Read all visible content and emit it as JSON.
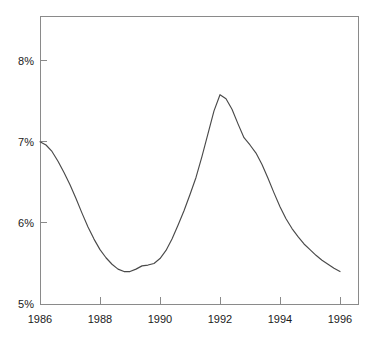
{
  "chart_data": {
    "type": "line",
    "title": "",
    "subtitle": "",
    "xlabel": "",
    "ylabel": "",
    "xlim": [
      1986,
      1996.6
    ],
    "ylim": [
      5,
      8.55
    ],
    "grid": false,
    "legend": null,
    "x_ticks": [
      1986,
      1988,
      1990,
      1992,
      1994,
      1996
    ],
    "x_tick_labels": [
      "1986",
      "1988",
      "1990",
      "1992",
      "1994",
      "1996"
    ],
    "y_ticks": [
      5,
      6,
      7,
      8
    ],
    "y_tick_labels": [
      "5%",
      "6%",
      "7%",
      "8%"
    ],
    "series": [
      {
        "name": "rate",
        "x": [
          1986.0,
          1986.2,
          1986.4,
          1986.6,
          1986.8,
          1987.0,
          1987.2,
          1987.4,
          1987.6,
          1987.8,
          1988.0,
          1988.2,
          1988.4,
          1988.6,
          1988.8,
          1989.0,
          1989.2,
          1989.4,
          1989.6,
          1989.8,
          1990.0,
          1990.2,
          1990.4,
          1990.6,
          1990.8,
          1991.0,
          1991.2,
          1991.4,
          1991.6,
          1991.8,
          1992.0,
          1992.2,
          1992.4,
          1992.6,
          1992.8,
          1993.0,
          1993.2,
          1993.4,
          1993.6,
          1993.8,
          1994.0,
          1994.2,
          1994.4,
          1994.6,
          1994.8,
          1995.0,
          1995.2,
          1995.4,
          1995.6,
          1995.8,
          1996.0
        ],
        "y": [
          7.0,
          6.96,
          6.88,
          6.76,
          6.62,
          6.47,
          6.3,
          6.12,
          5.95,
          5.8,
          5.67,
          5.57,
          5.49,
          5.43,
          5.4,
          5.4,
          5.43,
          5.47,
          5.48,
          5.5,
          5.56,
          5.66,
          5.8,
          5.97,
          6.15,
          6.35,
          6.56,
          6.82,
          7.1,
          7.38,
          7.58,
          7.53,
          7.4,
          7.22,
          7.05,
          6.96,
          6.86,
          6.72,
          6.55,
          6.37,
          6.2,
          6.05,
          5.93,
          5.83,
          5.74,
          5.67,
          5.6,
          5.54,
          5.49,
          5.44,
          5.4
        ]
      }
    ],
    "annotations": []
  },
  "axis_colors": {
    "axis": "#8a8a8a",
    "line": "#4a4a4a",
    "text": "#1a1a1a",
    "background": "#ffffff"
  },
  "plot_geometry": {
    "left": 40,
    "right": 358,
    "top": 16,
    "bottom": 304
  }
}
